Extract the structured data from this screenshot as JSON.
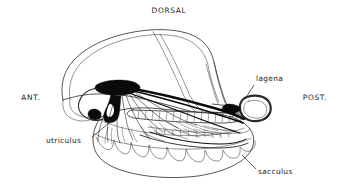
{
  "figure": {
    "background_color": "#ffffff",
    "ink_color": "#1c1c1c",
    "width": 338,
    "height": 195
  },
  "orientation_labels": [
    {
      "id": "dorsal",
      "text": "DORSAL",
      "x": 169,
      "y": 13,
      "anchor": "middle"
    },
    {
      "id": "anterior",
      "text": "ANT.",
      "x": 31,
      "y": 100,
      "anchor": "middle"
    },
    {
      "id": "posterior",
      "text": "POST.",
      "x": 315,
      "y": 100,
      "anchor": "middle"
    }
  ],
  "part_labels": [
    {
      "id": "lagena",
      "text": "lagena",
      "x": 256,
      "y": 81,
      "anchor": "start"
    },
    {
      "id": "utriculus",
      "text": "utriculus",
      "x": 46,
      "y": 143,
      "anchor": "start"
    },
    {
      "id": "sacculus",
      "text": "sacculus",
      "x": 258,
      "y": 174,
      "anchor": "start"
    }
  ],
  "leader_lines": [
    {
      "id": "lagena-leader",
      "from_x": 254,
      "from_y": 85,
      "to_x": 245,
      "to_y": 99
    },
    {
      "id": "utriculus-leader",
      "from_x": 92,
      "from_y": 137,
      "to_x": 115,
      "to_y": 118
    },
    {
      "id": "sacculus-leader",
      "from_x": 256,
      "from_y": 169,
      "to_x": 242,
      "to_y": 155
    }
  ],
  "structures": [
    {
      "id": "utriculus-chamber",
      "label": "utriculus",
      "description": "large dorsal chamber, thin double outline, internal septum"
    },
    {
      "id": "sacculus-chamber",
      "label": "sacculus",
      "description": "large ventral chamber with scalloped lobed lower margin"
    },
    {
      "id": "lagena-body",
      "label": "lagena",
      "description": "small posterior teardrop-shaped otolith organ, heavy black outline"
    },
    {
      "id": "macula-nerve-trunk",
      "label": "nerve trunk",
      "description": "solid black anvil-shaped macula and branching eighth-nerve fibres"
    },
    {
      "id": "saccular-macula",
      "label": "saccular macula",
      "description": "elongate striated sensory band running antero-posteriorly"
    }
  ]
}
